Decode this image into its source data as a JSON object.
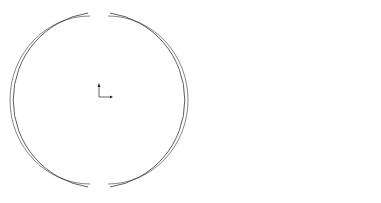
{
  "figure": {
    "left_panel": {
      "description": "Split ring model (two arc segments) with coordinate axes",
      "axes": {
        "x_label": "X",
        "y_label": "Y",
        "z_label": "Z"
      }
    },
    "right_panel": {
      "description": "Spherical lattice cable-strut structure with central diamond cable net",
      "center_marker": "origin"
    },
    "colors": {
      "line": "#333333",
      "light_line": "#8a8a8a",
      "background": "#ffffff"
    }
  }
}
